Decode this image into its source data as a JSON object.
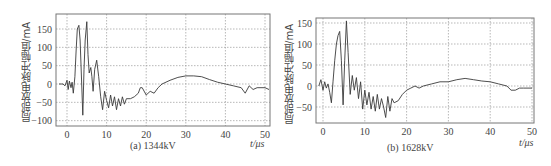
{
  "chart_data": [
    {
      "type": "line",
      "title": "",
      "caption": "(a) 1344kV",
      "xlabel": "t/μs",
      "ylabel": "局部放电脉冲幅值/mA",
      "xlim": [
        -2,
        51
      ],
      "ylim": [
        -110,
        190
      ],
      "xticks": [
        0,
        10,
        20,
        30,
        40,
        50
      ],
      "yticks": [
        150,
        100,
        50,
        0,
        -50,
        -100
      ],
      "ytick_labels": [
        "150",
        "100",
        "50",
        "0",
        "−50",
        "−100"
      ],
      "grid": true,
      "series": [
        {
          "name": "1344kV",
          "x": [
            -2,
            -1,
            -0.5,
            0,
            0.3,
            0.6,
            1,
            1.3,
            1.6,
            2,
            2.3,
            2.6,
            3,
            3.3,
            3.6,
            4,
            4.3,
            4.6,
            5,
            5.3,
            5.6,
            6,
            6.3,
            6.6,
            7,
            7.5,
            8,
            8.5,
            9,
            9.5,
            10,
            10.5,
            11,
            11.5,
            12,
            12.5,
            13,
            13.5,
            14,
            14.5,
            15,
            16,
            17,
            18,
            18.5,
            19,
            20,
            21,
            22,
            23,
            24,
            26,
            28,
            30,
            32,
            34,
            36,
            38,
            40,
            42,
            44,
            45,
            46,
            47,
            48,
            50,
            51
          ],
          "y": [
            0,
            0,
            -5,
            10,
            -15,
            8,
            -10,
            5,
            -25,
            20,
            90,
            150,
            160,
            120,
            30,
            -85,
            40,
            120,
            170,
            80,
            30,
            45,
            20,
            -20,
            40,
            65,
            20,
            -35,
            -70,
            -20,
            -45,
            -65,
            -30,
            -60,
            -35,
            -70,
            -40,
            -60,
            -35,
            -55,
            -40,
            -40,
            -35,
            -25,
            -10,
            -10,
            -30,
            -20,
            -25,
            -10,
            0,
            10,
            18,
            22,
            22,
            20,
            12,
            5,
            0,
            -5,
            -10,
            -25,
            -5,
            -15,
            -10,
            -10,
            -15
          ]
        }
      ]
    },
    {
      "type": "line",
      "title": "",
      "caption": "(b) 1628kV",
      "xlabel": "t/μs",
      "ylabel": "局部放电脉冲幅值/mA",
      "xlim": [
        -1,
        51
      ],
      "ylim": [
        -90,
        160
      ],
      "xticks": [
        0,
        10,
        20,
        30,
        40,
        50
      ],
      "yticks": [
        150,
        100,
        50,
        0,
        -50
      ],
      "ytick_labels": [
        "150",
        "100",
        "50",
        "0",
        "−50"
      ],
      "grid": true,
      "series": [
        {
          "name": "1628kV",
          "x": [
            -1,
            -0.5,
            0,
            0.4,
            0.8,
            1.2,
            1.6,
            2,
            2.4,
            2.8,
            3.2,
            3.6,
            4,
            4.4,
            4.8,
            5.2,
            5.6,
            6,
            6.5,
            7,
            7.5,
            8,
            8.5,
            9,
            9.5,
            10,
            10.5,
            11,
            11.5,
            12,
            12.5,
            13,
            13.5,
            14,
            14.5,
            15,
            15.5,
            16,
            16.5,
            17,
            18,
            19,
            20,
            21,
            22,
            23,
            24,
            26,
            28,
            30,
            32,
            34,
            36,
            38,
            40,
            42,
            44,
            45,
            46,
            47,
            48,
            50
          ],
          "y": [
            0,
            15,
            -10,
            10,
            -5,
            5,
            -15,
            -40,
            10,
            60,
            100,
            120,
            130,
            60,
            -45,
            60,
            155,
            80,
            -20,
            25,
            -10,
            20,
            -30,
            10,
            -55,
            -10,
            -45,
            -15,
            -55,
            -25,
            -60,
            -20,
            -55,
            -30,
            -50,
            -75,
            -25,
            -60,
            -30,
            -40,
            -35,
            -20,
            -10,
            -5,
            0,
            -5,
            0,
            5,
            10,
            10,
            15,
            18,
            15,
            12,
            10,
            5,
            0,
            -10,
            -10,
            -5,
            -5,
            -5
          ]
        }
      ]
    }
  ],
  "panels": {
    "a": {
      "caption": "(a) 1344kV",
      "ylabel": "局部放电脉冲幅值/mA",
      "xunit": "t/μs"
    },
    "b": {
      "caption": "(b) 1628kV",
      "ylabel": "局部放电脉冲幅值/mA",
      "xunit": "t/μs"
    }
  },
  "colors": {
    "line": "#3a3a3a",
    "grid": "#9a9a9a",
    "frame": "#777777"
  }
}
